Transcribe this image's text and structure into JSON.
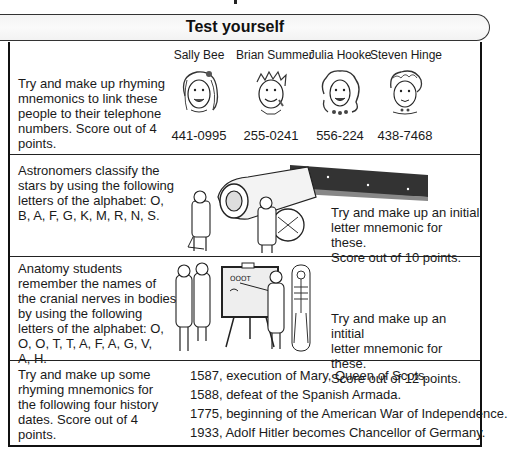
{
  "header": {
    "title": "Test yourself"
  },
  "rows": [
    {
      "instruction": "Try and make up rhyming mnemonics to link these people to their telephone numbers. Score out of 4 points.",
      "instruction_lines": [
        "Try and make up rhyming",
        "mnemonics to link these",
        "people to their telephone",
        "numbers. Score out of 4",
        "points."
      ],
      "people": [
        {
          "name": "Sally Bee",
          "phone": "441-0995",
          "icon": "cartoon-face-icon"
        },
        {
          "name": "Brian Summer",
          "phone": "255-0241",
          "icon": "cartoon-face-icon"
        },
        {
          "name": "Julia Hooke",
          "phone": "556-224",
          "icon": "cartoon-face-icon"
        },
        {
          "name": "Steven Hinge",
          "phone": "438-7468",
          "icon": "cartoon-face-icon"
        }
      ]
    },
    {
      "description_lines": [
        "Astronomers classify the",
        "stars by using the following",
        "letters of the alphabet: O,",
        "B, A, F, G, K, M, R, N, S."
      ],
      "illustration": "telescope-astronomers-illustration",
      "task_lines": [
        "Try and make up an initial",
        "letter mnemonic for these.",
        "Score out of 10 points."
      ]
    },
    {
      "description_lines": [
        "Anatomy students",
        "remember the names of",
        "the cranial nerves in bodies",
        "by using the following",
        "letters of the alphabet: O,",
        "O, O, T, T, A, F, A, G, V,",
        "A, H."
      ],
      "illustration": "anatomy-class-illustration",
      "board_text": "OOOT",
      "task_lines": [
        "Try and make up an intitial",
        "letter mnemonic for these.",
        "Score out of 12 points."
      ]
    },
    {
      "instruction_lines": [
        "Try and make up some",
        "rhyming mnemonics for",
        "the following four history",
        "dates. Score out of 4",
        "points."
      ],
      "dates": [
        "1587, execution of Mary, Queen of Scots.",
        "1588, defeat of the Spanish Armada.",
        "1775, beginning of the American War of Independence.",
        "1933, Adolf Hitler becomes Chancellor of Germany."
      ]
    }
  ]
}
